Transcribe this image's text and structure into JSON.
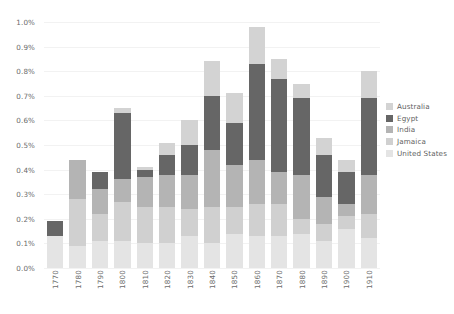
{
  "chart_data": {
    "type": "bar",
    "stacked": true,
    "title": "",
    "subtitle": "",
    "xlabel": "",
    "ylabel": "",
    "grid": true,
    "legend_position": "right",
    "ylim": [
      0,
      0.01
    ],
    "y_tick_values": [
      0.0,
      0.001,
      0.002,
      0.003,
      0.004,
      0.005,
      0.006,
      0.007,
      0.008,
      0.009,
      0.01
    ],
    "y_tick_labels": [
      "0.0%",
      "0.1%",
      "0.2%",
      "0.3%",
      "0.4%",
      "0.5%",
      "0.6%",
      "0.7%",
      "0.8%",
      "0.9%",
      "1.0%"
    ],
    "categories": [
      "1770",
      "1780",
      "1790",
      "1800",
      "1810",
      "1820",
      "1830",
      "1840",
      "1850",
      "1860",
      "1870",
      "1880",
      "1890",
      "1900",
      "1910"
    ],
    "series": [
      {
        "name": "United States",
        "color": "#e4e4e4",
        "values": [
          0.0013,
          0.0009,
          0.0011,
          0.0011,
          0.001,
          0.001,
          0.0013,
          0.001,
          0.0014,
          0.0013,
          0.0013,
          0.0014,
          0.0011,
          0.0016,
          0.0012
        ]
      },
      {
        "name": "Jamaica",
        "color": "#d0d0d0",
        "values": [
          0.0,
          0.0019,
          0.0011,
          0.0016,
          0.0015,
          0.0015,
          0.0011,
          0.0015,
          0.0011,
          0.0013,
          0.0013,
          0.0006,
          0.0007,
          0.0005,
          0.001
        ]
      },
      {
        "name": "India",
        "color": "#b4b4b4",
        "values": [
          0.0,
          0.0016,
          0.001,
          0.0009,
          0.0012,
          0.0013,
          0.0014,
          0.0023,
          0.0017,
          0.0018,
          0.0013,
          0.0018,
          0.0011,
          0.0005,
          0.0016
        ]
      },
      {
        "name": "Egypt",
        "color": "#666666",
        "values": [
          0.0006,
          0.0,
          0.0007,
          0.0027,
          0.0003,
          0.0008,
          0.0012,
          0.0022,
          0.0017,
          0.0039,
          0.0038,
          0.0031,
          0.0017,
          0.0013,
          0.0031
        ]
      },
      {
        "name": "Australia",
        "color": "#d3d3d3",
        "values": [
          0.0,
          0.0,
          0.0,
          0.0002,
          0.0001,
          0.0005,
          0.001,
          0.0014,
          0.0012,
          0.0015,
          0.0008,
          0.0006,
          0.0007,
          0.0005,
          0.0011
        ]
      }
    ]
  },
  "legend": {
    "items": [
      {
        "label": "Australia"
      },
      {
        "label": "Egypt"
      },
      {
        "label": "India"
      },
      {
        "label": "Jamaica"
      },
      {
        "label": "United States"
      }
    ]
  },
  "colors": {
    "background": "#ffffff",
    "gridline": "#f2f2f2",
    "tick_text": "#6b6b6b",
    "legend_text": "#5f5f5f"
  }
}
